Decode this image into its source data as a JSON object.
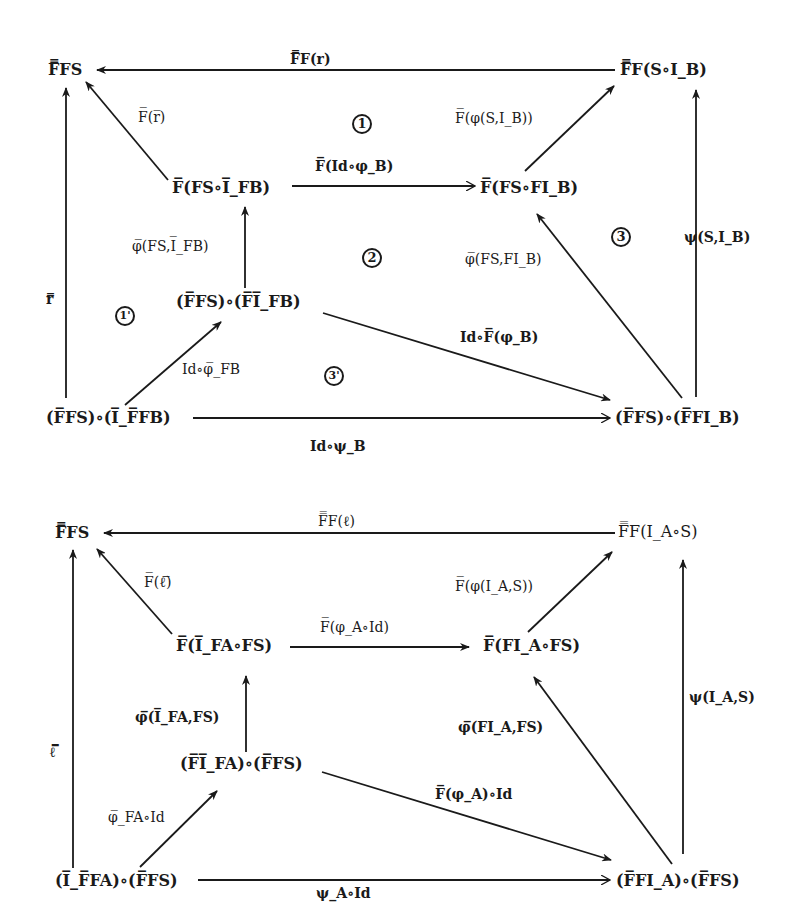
{
  "diagrams": [
    {
      "name": "top-diagram",
      "nodes": {
        "n_ffs": "F̿FS",
        "n_ff_s_ib": "F̿F(S∘I_B)",
        "n_f_fs_ifb": "F̅(FS∘I̅_FB)",
        "n_f_fs_fib": "F̅(FS∘FI_B)",
        "n_ffs_fifb": "(F̅FS)∘(F̅I̅_FB)",
        "n_ffs_iffb": "(F̅FS)∘(I̅_F̅FB)",
        "n_ffs_ffib": "(F̅FS)∘(F̅FI_B)"
      },
      "edges": {
        "e_top": "F̿F(r)",
        "e_diag_ul": "F̅(r̅)",
        "e_mid_h": "F̅(Id∘φ_B)",
        "e_diag_ur": "F̅(φ(S,I_B))",
        "e_vert_mid": "φ̅(FS,I̅_FB)",
        "e_diag_rl": "φ̅(FS,FI_B)",
        "e_right_v": "ψ(S,I_B)",
        "e_left_v": "r̿",
        "e_diag_ll": "Id∘φ̅_FB",
        "e_diag_lr": "Id∘F̅(φ_B)",
        "e_bottom": "Id∘ψ_B"
      },
      "regions": [
        "1",
        "2",
        "3",
        "1'",
        "3'"
      ]
    },
    {
      "name": "bottom-diagram",
      "nodes": {
        "n_ffs": "F̿FS",
        "n_ff_ia_s": "F̿F(I_A∘S)",
        "n_f_ifa_fs": "F̅(I̅_FA∘FS)",
        "n_f_fia_fs": "F̅(FI_A∘FS)",
        "n_fifa_ffs": "(F̅I̅_FA)∘(F̅FS)",
        "n_iffa_ffs": "(I̅_F̅FA)∘(F̅FS)",
        "n_ffia_ffs": "(F̅FI_A)∘(F̅FS)"
      },
      "edges": {
        "e_top": "F̿F(ℓ)",
        "e_diag_ul": "F̅(ℓ̅)",
        "e_mid_h": "F̅(φ_A∘Id)",
        "e_diag_ur": "F̅(φ(I_A,S))",
        "e_vert_mid": "φ̅(I̅_FA,FS)",
        "e_diag_rl": "φ̅(FI_A,FS)",
        "e_right_v": "ψ(I_A,S)",
        "e_left_v": "ℓ̿",
        "e_diag_ll": "φ̅_FA∘Id",
        "e_diag_lr": "F̅(φ_A)∘Id",
        "e_bottom": "ψ_A∘Id"
      }
    }
  ]
}
